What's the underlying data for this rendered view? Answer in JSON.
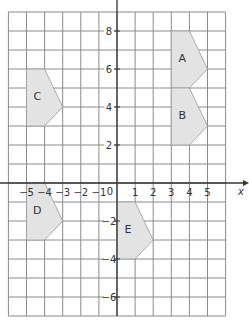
{
  "diagram": {
    "type": "coordinate-grid",
    "x_range": [
      -6,
      6
    ],
    "y_range": [
      -7,
      9
    ],
    "x_axis_label": "x",
    "origin_label": "0",
    "x_tick_labels": [
      "-5",
      "-4",
      "-3",
      "-2",
      "-1",
      "1",
      "2",
      "3",
      "4",
      "5"
    ],
    "x_tick_values": [
      -5,
      -4,
      -3,
      -2,
      -1,
      1,
      2,
      3,
      4,
      5
    ],
    "y_tick_labels": [
      "8",
      "6",
      "4",
      "2",
      "-2",
      "-4",
      "-6"
    ],
    "y_tick_values": [
      8,
      6,
      4,
      2,
      -2,
      -4,
      -6
    ],
    "shape_fill": "#e3e3e3",
    "shapes": [
      {
        "label": "A",
        "points": [
          [
            3,
            5
          ],
          [
            3,
            8
          ],
          [
            4,
            8
          ],
          [
            5,
            6
          ],
          [
            4,
            5
          ]
        ],
        "label_pos": [
          3.6,
          6.6
        ]
      },
      {
        "label": "B",
        "points": [
          [
            3,
            2
          ],
          [
            3,
            5
          ],
          [
            4,
            5
          ],
          [
            5,
            3
          ],
          [
            4,
            2
          ]
        ],
        "label_pos": [
          3.6,
          3.6
        ]
      },
      {
        "label": "C",
        "points": [
          [
            -5,
            3
          ],
          [
            -5,
            6
          ],
          [
            -4,
            6
          ],
          [
            -3,
            4
          ],
          [
            -4,
            3
          ]
        ],
        "label_pos": [
          -4.4,
          4.6
        ]
      },
      {
        "label": "D",
        "points": [
          [
            -5,
            -3
          ],
          [
            -5,
            0
          ],
          [
            -4,
            0
          ],
          [
            -3,
            -2
          ],
          [
            -4,
            -3
          ]
        ],
        "label_pos": [
          -4.4,
          -1.4
        ]
      },
      {
        "label": "E",
        "points": [
          [
            0,
            -4
          ],
          [
            0,
            -1
          ],
          [
            1,
            -1
          ],
          [
            2,
            -3
          ],
          [
            1,
            -4
          ]
        ],
        "label_pos": [
          0.6,
          -2.4
        ]
      }
    ]
  }
}
